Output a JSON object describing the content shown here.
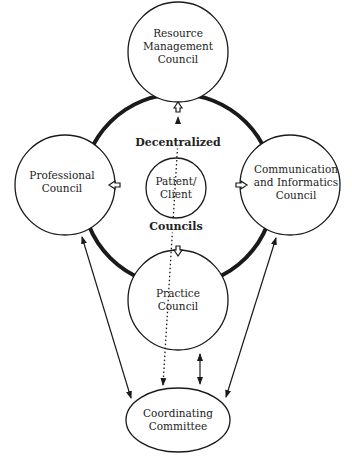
{
  "nodes": {
    "resource": {
      "line1": "Resource",
      "line2": "Management",
      "line3": "Council"
    },
    "professional": {
      "line1": "Professional",
      "line2": "Council"
    },
    "communication": {
      "line1": "Communication",
      "line2": "and Informatics",
      "line3": "Council"
    },
    "practice": {
      "line1": "Practice",
      "line2": "Council"
    },
    "patient": {
      "line1": "Patient/",
      "line2": "Client"
    },
    "coordinating": {
      "line1": "Coordinating",
      "line2": "Committee"
    }
  },
  "ring_labels": {
    "top": "Decentralized",
    "bottom": "Councils"
  },
  "colors": {
    "stroke": "#1a1a1a",
    "background": "#ffffff"
  }
}
